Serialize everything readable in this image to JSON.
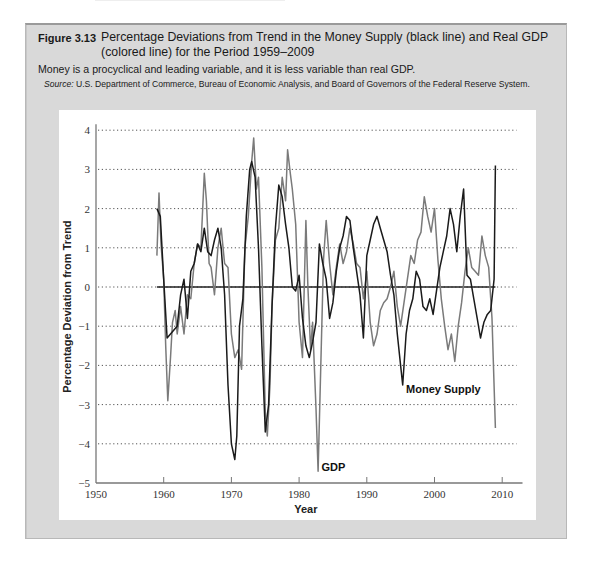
{
  "figure": {
    "number": "Figure 3.13",
    "title": "Percentage Deviations from Trend in the Money Supply (black line) and Real GDP (colored line) for the Period 1959–2009",
    "subtitle": "Money is a procyclical and leading variable, and it is less variable than real GDP.",
    "source_label": "Source:",
    "source_text": "U.S. Department of Commerce, Bureau of Economic Analysis, and Board of Governors of the Federal Reserve System."
  },
  "colors": {
    "money_supply": "#1a1a1a",
    "gdp": "#7a7a7a",
    "frame": "#d9d9d9",
    "gridline": "#555555"
  },
  "chart_data": {
    "type": "line",
    "title": "Percentage Deviations from Trend in the Money Supply (black line) and Real GDP (colored line) for the Period 1959–2009",
    "xlabel": "Year",
    "ylabel": "Percentage Deviation from Trend",
    "xlim": [
      1950,
      2013
    ],
    "ylim": [
      -5,
      4
    ],
    "xticks": [
      1950,
      1960,
      1970,
      1980,
      1990,
      2000,
      2010
    ],
    "yticks": [
      4,
      3,
      2,
      1,
      0,
      -1,
      -2,
      -3,
      -4,
      -5
    ],
    "grid": "horizontal dotted",
    "zero_line": {
      "from": 1959,
      "to": 2009,
      "value": 0
    },
    "annotations": [
      {
        "text": "Money Supply",
        "x": 1995.8,
        "y": -2.6
      },
      {
        "text": "GDP",
        "x": 1983.3,
        "y": -4.6
      }
    ],
    "series": [
      {
        "name": "Money Supply",
        "x": [
          1959.0,
          1959.5,
          1960.0,
          1960.5,
          1961.0,
          1961.5,
          1962.0,
          1962.5,
          1963.0,
          1963.5,
          1964.0,
          1964.5,
          1965.0,
          1965.5,
          1966.0,
          1966.5,
          1967.0,
          1967.5,
          1968.0,
          1968.5,
          1969.0,
          1969.5,
          1970.0,
          1970.5,
          1970.8,
          1971.2,
          1971.7,
          1972.2,
          1972.7,
          1973.0,
          1973.5,
          1974.0,
          1974.5,
          1975.0,
          1975.5,
          1976.0,
          1976.5,
          1977.0,
          1977.5,
          1978.0,
          1978.5,
          1979.0,
          1979.5,
          1980.0,
          1980.5,
          1981.0,
          1981.5,
          1982.0,
          1982.5,
          1983.0,
          1983.5,
          1984.0,
          1984.5,
          1985.0,
          1985.5,
          1986.0,
          1986.5,
          1987.0,
          1987.5,
          1988.0,
          1988.5,
          1989.0,
          1989.5,
          1990.0,
          1990.5,
          1991.0,
          1991.5,
          1992.0,
          1992.5,
          1993.0,
          1993.5,
          1994.0,
          1994.5,
          1995.0,
          1995.3,
          1995.8,
          1996.3,
          1996.8,
          1997.3,
          1997.8,
          1998.3,
          1998.8,
          1999.3,
          1999.8,
          2000.3,
          2000.8,
          2001.3,
          2001.8,
          2002.3,
          2002.8,
          2003.3,
          2003.8,
          2004.3,
          2004.8,
          2005.3,
          2005.8,
          2006.3,
          2006.8,
          2007.3,
          2007.8,
          2008.3,
          2008.8,
          2009.0
        ],
        "values": [
          2.0,
          1.8,
          0.2,
          -1.3,
          -1.2,
          -1.1,
          -1.0,
          -0.2,
          0.2,
          -0.8,
          0.4,
          0.6,
          1.1,
          0.9,
          1.5,
          0.9,
          0.8,
          1.2,
          1.5,
          1.0,
          -0.2,
          -2.5,
          -4.0,
          -4.4,
          -3.8,
          -1.0,
          -0.3,
          1.8,
          3.0,
          3.2,
          2.8,
          1.0,
          -1.5,
          -3.7,
          -3.0,
          -0.5,
          1.5,
          2.6,
          2.3,
          1.6,
          1.0,
          0.0,
          -0.1,
          0.3,
          -0.8,
          -1.5,
          -1.8,
          -1.4,
          -0.9,
          1.1,
          0.6,
          0.2,
          -0.8,
          -0.4,
          0.4,
          1.0,
          1.3,
          1.8,
          1.7,
          1.0,
          0.4,
          -0.2,
          -1.3,
          0.8,
          1.2,
          1.6,
          1.8,
          1.5,
          1.2,
          0.9,
          0.3,
          -0.2,
          -1.2,
          -2.0,
          -2.5,
          -1.2,
          -0.6,
          -0.3,
          0.4,
          0.2,
          -0.5,
          -0.6,
          -0.3,
          -0.7,
          -0.1,
          0.5,
          0.9,
          1.3,
          2.0,
          1.6,
          0.9,
          1.8,
          2.5,
          0.3,
          0.2,
          -0.3,
          -0.8,
          -1.3,
          -0.9,
          -0.7,
          -0.6,
          0.2,
          3.1
        ]
      },
      {
        "name": "GDP",
        "x": [
          1959.0,
          1959.3,
          1959.6,
          1960.0,
          1960.3,
          1960.6,
          1961.0,
          1961.3,
          1961.7,
          1962.0,
          1962.5,
          1963.0,
          1963.5,
          1964.0,
          1964.5,
          1965.0,
          1965.5,
          1966.0,
          1966.3,
          1966.7,
          1967.0,
          1967.5,
          1968.0,
          1968.5,
          1969.0,
          1969.5,
          1970.0,
          1970.5,
          1971.0,
          1971.5,
          1972.0,
          1972.5,
          1973.0,
          1973.3,
          1973.7,
          1974.0,
          1974.5,
          1975.0,
          1975.3,
          1975.7,
          1976.0,
          1976.5,
          1977.0,
          1977.5,
          1978.0,
          1978.3,
          1978.7,
          1979.0,
          1979.5,
          1980.0,
          1980.5,
          1981.0,
          1981.3,
          1981.7,
          1982.0,
          1982.5,
          1982.8,
          1983.2,
          1983.6,
          1984.0,
          1984.5,
          1985.0,
          1985.5,
          1986.0,
          1986.5,
          1987.0,
          1987.5,
          1988.0,
          1988.5,
          1989.0,
          1989.5,
          1990.0,
          1990.5,
          1991.0,
          1991.5,
          1992.0,
          1992.5,
          1993.0,
          1993.5,
          1994.0,
          1994.5,
          1995.0,
          1995.5,
          1996.0,
          1996.5,
          1997.0,
          1997.5,
          1998.0,
          1998.5,
          1999.0,
          1999.5,
          2000.0,
          2000.5,
          2001.0,
          2001.5,
          2002.0,
          2002.5,
          2003.0,
          2003.5,
          2004.0,
          2004.5,
          2005.0,
          2005.5,
          2006.0,
          2006.5,
          2007.0,
          2007.5,
          2008.0,
          2008.5,
          2009.0
        ],
        "values": [
          0.8,
          2.4,
          1.1,
          0.2,
          -1.5,
          -2.9,
          -1.8,
          -0.9,
          -0.6,
          -1.2,
          -0.5,
          -1.2,
          -0.2,
          -0.3,
          0.6,
          1.1,
          1.0,
          2.9,
          2.2,
          0.6,
          0.5,
          -0.2,
          1.0,
          1.5,
          0.6,
          0.5,
          -1.2,
          -1.8,
          -1.6,
          -2.1,
          1.0,
          1.8,
          3.2,
          3.8,
          2.5,
          2.8,
          0.5,
          -3.2,
          -3.8,
          -2.5,
          -0.5,
          1.2,
          1.5,
          2.8,
          2.2,
          3.5,
          2.9,
          2.5,
          1.6,
          -0.9,
          -1.8,
          1.7,
          0.0,
          -1.6,
          -0.9,
          -3.1,
          -4.7,
          -2.0,
          0.7,
          1.7,
          0.6,
          -0.2,
          0.5,
          1.1,
          0.6,
          0.9,
          1.5,
          1.1,
          0.6,
          0.5,
          -0.3,
          0.4,
          -0.9,
          -1.5,
          -1.2,
          -0.6,
          -0.4,
          -0.3,
          0.0,
          0.4,
          -0.5,
          -1.0,
          -0.4,
          0.2,
          0.8,
          0.6,
          1.2,
          1.4,
          2.3,
          1.8,
          1.4,
          2.0,
          0.7,
          -0.3,
          -1.0,
          -1.6,
          -1.2,
          -1.9,
          -1.0,
          -0.4,
          0.4,
          1.0,
          0.5,
          0.4,
          0.3,
          1.3,
          0.8,
          0.5,
          -0.8,
          -3.6
        ]
      }
    ]
  }
}
